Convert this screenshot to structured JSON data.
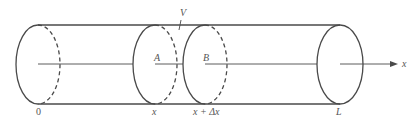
{
  "diagram": {
    "labels": {
      "volume": "V",
      "cross_section_left": "A",
      "cross_section_right": "B",
      "origin": "0",
      "position": "x",
      "position_plus": "x + Δx",
      "length": "L",
      "axis": "x"
    },
    "colors": {
      "line": "#4a4a4a",
      "text": "#555555",
      "background": "#ffffff"
    }
  }
}
